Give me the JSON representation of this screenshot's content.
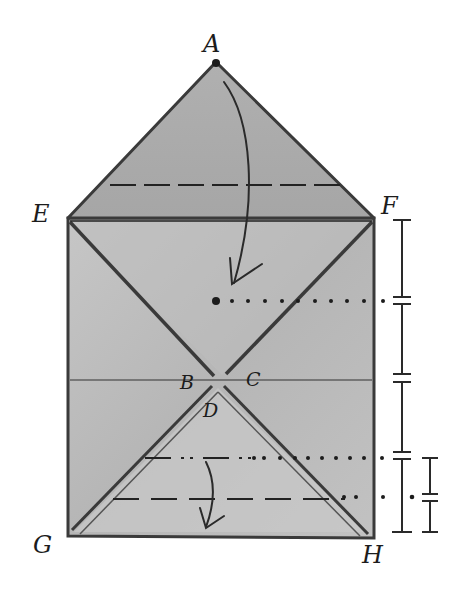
{
  "diagram": {
    "background": "#ffffff",
    "paper_color": "#b9b9b9",
    "paper_light": "#cfcfcf",
    "ink_color": "#1c1c1c",
    "points": {
      "A": {
        "label": "A",
        "x": 216,
        "y": 62
      },
      "E": {
        "label": "E",
        "x": 68,
        "y": 218
      },
      "F": {
        "label": "F",
        "x": 374,
        "y": 218
      },
      "B": {
        "label": "B",
        "x": 210,
        "y": 378
      },
      "C": {
        "label": "C",
        "x": 226,
        "y": 378
      },
      "D": {
        "label": "D",
        "x": 218,
        "y": 390
      },
      "G": {
        "label": "G",
        "x": 68,
        "y": 536
      },
      "H": {
        "label": "H",
        "x": 374,
        "y": 536
      }
    },
    "labels": [
      "A",
      "E",
      "F",
      "B",
      "C",
      "D",
      "G",
      "H"
    ],
    "fold_lines": [
      {
        "name": "dashed-fold-top",
        "style": "dashed",
        "y": 185
      },
      {
        "name": "solid-line-EF",
        "style": "solid",
        "y": 220
      },
      {
        "name": "dotted-guide-middle",
        "style": "dotted",
        "y": 300
      },
      {
        "name": "solid-line-BC",
        "style": "solid",
        "y": 380
      },
      {
        "name": "dash-dot-fold-lower",
        "style": "dash-dot",
        "y": 458
      },
      {
        "name": "dashed-fold-bottom",
        "style": "dashed",
        "y": 499
      }
    ],
    "arrows": [
      {
        "name": "fold-arrow-top",
        "from": "A",
        "direction": "down"
      },
      {
        "name": "fold-arrow-bottom",
        "direction": "down"
      }
    ],
    "measures": {
      "main_bar": {
        "segments": 4,
        "equal": true
      },
      "small_bar": {
        "segments": 2,
        "equal": true
      }
    }
  }
}
